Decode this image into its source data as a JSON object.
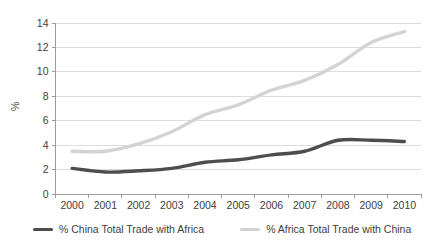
{
  "chart_data": {
    "type": "line",
    "title": "",
    "xlabel": "",
    "ylabel": "%",
    "categories": [
      "2000",
      "2001",
      "2002",
      "2003",
      "2004",
      "2005",
      "2006",
      "2007",
      "2008",
      "2009",
      "2010"
    ],
    "series": [
      {
        "name": "% China Total Trade with Africa",
        "color": "#4d4d4d",
        "values": [
          2.1,
          1.8,
          1.9,
          2.1,
          2.6,
          2.8,
          3.2,
          3.5,
          4.4,
          4.4,
          4.3
        ]
      },
      {
        "name": "% Africa Total Trade with China",
        "color": "#d3d3d3",
        "values": [
          3.5,
          3.5,
          4.1,
          5.1,
          6.5,
          7.3,
          8.5,
          9.3,
          10.6,
          12.4,
          13.3
        ]
      }
    ],
    "ylim": [
      0,
      14
    ],
    "ytick_step": 2,
    "yticks": [
      "0",
      "2",
      "4",
      "6",
      "8",
      "10",
      "12",
      "14"
    ],
    "grid": true,
    "gridline_color": "#dcdcdc",
    "axis_color": "#9b9b9b",
    "tick_label_color": "#404040",
    "legend_position": "bottom"
  }
}
